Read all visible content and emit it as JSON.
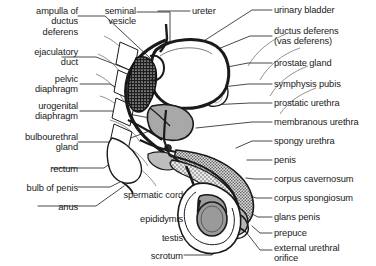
{
  "figure": {
    "style": {
      "line_color": "#1a1a1a",
      "label_color": "#1a1a1a",
      "background": "#ffffff",
      "testis_fill": "#9a9a9a",
      "prostate_fill": "#a8a8a8",
      "stipple_fill": "#c9c9c9",
      "seminal_vesicle_fill": "#242424",
      "bladder_fill": "#ffffff"
    }
  },
  "labels_left": [
    {
      "id": "ampulla-of-ductus-deferens",
      "text": "ampulla of\nductus\ndeferens",
      "x": 2,
      "y": 6,
      "w": 76
    },
    {
      "id": "ejaculatory-duct",
      "text": "ejaculatory\nduct",
      "x": 2,
      "y": 47,
      "w": 76
    },
    {
      "id": "pelvic-diaphragm",
      "text": "pelvic\ndiaphragm",
      "x": 2,
      "y": 74,
      "w": 76
    },
    {
      "id": "urogenital-diaphragm",
      "text": "urogenital\ndiaphragm",
      "x": 2,
      "y": 101,
      "w": 76
    },
    {
      "id": "bulbourethral-gland",
      "text": "bulbourethral\ngland",
      "x": 2,
      "y": 132,
      "w": 76
    },
    {
      "id": "rectum",
      "text": "rectum",
      "x": 2,
      "y": 164,
      "w": 76
    },
    {
      "id": "bulb-of-penis",
      "text": "bulb of penis",
      "x": 2,
      "y": 183,
      "w": 76
    },
    {
      "id": "anus",
      "text": "anus",
      "x": 2,
      "y": 202,
      "w": 76
    }
  ],
  "labels_mid": [
    {
      "id": "seminal-vesicle",
      "text": "seminal\nvesicle",
      "x": 80,
      "y": 6,
      "w": 56
    },
    {
      "id": "spermatic-cord",
      "text": "spermatic cord",
      "x": 103,
      "y": 190,
      "w": 80
    },
    {
      "id": "epididymis",
      "text": "epididymis",
      "x": 103,
      "y": 214,
      "w": 80
    },
    {
      "id": "testis",
      "text": "testis",
      "x": 103,
      "y": 233,
      "w": 80
    },
    {
      "id": "scrotum",
      "text": "scrotum",
      "x": 103,
      "y": 251,
      "w": 80
    }
  ],
  "labels_top": [
    {
      "id": "ureter",
      "text": "ureter",
      "x": 192,
      "y": 6,
      "w": 50
    }
  ],
  "labels_right": [
    {
      "id": "urinary-bladder",
      "text": "urinary bladder",
      "x": 274,
      "y": 6
    },
    {
      "id": "ductus-deferens",
      "text": "ductus deferens\n(vas deferens)",
      "x": 274,
      "y": 28
    },
    {
      "id": "prostate-gland",
      "text": "prostate gland",
      "x": 274,
      "y": 59
    },
    {
      "id": "symphysis-pubis",
      "text": "symphysis pubis",
      "x": 274,
      "y": 80
    },
    {
      "id": "prostatic-urethra",
      "text": "prostatic urethra",
      "x": 274,
      "y": 99
    },
    {
      "id": "membranous-urethra",
      "text": "membranous urethra",
      "x": 274,
      "y": 118
    },
    {
      "id": "spongy-urethra",
      "text": "spongy urethra",
      "x": 274,
      "y": 137
    },
    {
      "id": "penis",
      "text": "penis",
      "x": 274,
      "y": 156
    },
    {
      "id": "corpus-cavernosum",
      "text": "corpus cavernosum",
      "x": 274,
      "y": 175
    },
    {
      "id": "corpus-spongiosum",
      "text": "corpus spongiosum",
      "x": 274,
      "y": 194
    },
    {
      "id": "glans-penis",
      "text": "glans penis",
      "x": 274,
      "y": 213
    },
    {
      "id": "prepuce",
      "text": "prepuce",
      "x": 274,
      "y": 229
    },
    {
      "id": "external-urethral-orifice",
      "text": "external urethral\norifice",
      "x": 274,
      "y": 244
    }
  ]
}
